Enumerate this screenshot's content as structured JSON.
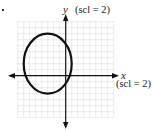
{
  "chart_data": {
    "type": "line",
    "title": "",
    "subtitle": "Graph of an ellipse on a coordinate grid",
    "xlabel": "x",
    "ylabel": "y",
    "x_scale_label": "(scl = 2)",
    "y_scale_label": "(scl = 2)",
    "xlim": [
      -8,
      8
    ],
    "ylim": [
      -7,
      9
    ],
    "grid": true,
    "grid_style": "dotted",
    "legend": null,
    "series": [
      {
        "name": "ellipse",
        "shape": "ellipse",
        "center": [
          -3,
          2
        ],
        "semi_axis_x": 4,
        "semi_axis_y": 5,
        "extents": {
          "left": -7,
          "right": 1,
          "top": 7,
          "bottom": -3
        },
        "color": "#111111"
      }
    ]
  },
  "labels": {
    "y_axis": "y",
    "y_scale": "(scl = 2)",
    "x_axis": "x",
    "x_scale": "(scl = 2)"
  },
  "colors": {
    "grid": "#bdbdbd",
    "axis": "#111111",
    "curve": "#111111"
  }
}
